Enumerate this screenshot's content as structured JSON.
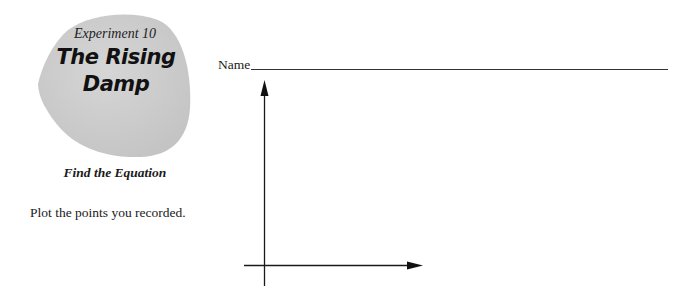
{
  "header": {
    "experiment_label": "Experiment 10",
    "title_line1": "The Rising",
    "title_line2": "Damp",
    "subtitle": "Find the Equation"
  },
  "name_field": {
    "label": "Name",
    "value": ""
  },
  "instruction": "Plot the points you recorded.",
  "graph": {
    "type": "blank-axes",
    "x_axis": {
      "label": "",
      "arrow": "right"
    },
    "y_axis": {
      "label": "",
      "arrow": "up"
    }
  },
  "colors": {
    "stone_fill": "#cfcfcf",
    "ink": "#1a1a1a"
  }
}
